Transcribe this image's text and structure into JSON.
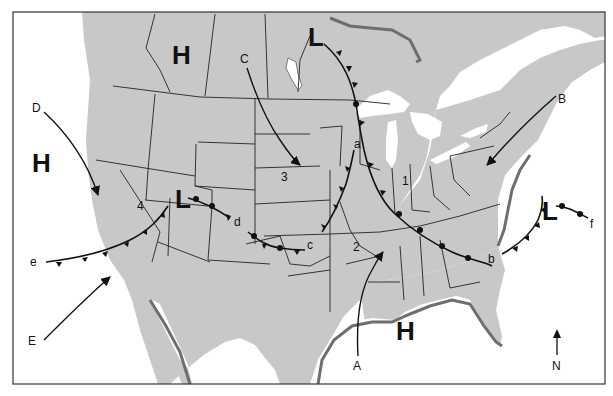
{
  "pressure_centers": [
    {
      "id": "high-canada",
      "symbol": "H",
      "type": "high"
    },
    {
      "id": "high-pacific",
      "symbol": "H",
      "type": "high"
    },
    {
      "id": "high-gulf",
      "symbol": "H",
      "type": "high"
    },
    {
      "id": "low-manitoba",
      "symbol": "L",
      "type": "low"
    },
    {
      "id": "low-utah",
      "symbol": "L",
      "type": "low"
    },
    {
      "id": "low-atlantic",
      "symbol": "L",
      "type": "low"
    }
  ],
  "fronts": [
    {
      "label": "a",
      "type": "cold"
    },
    {
      "label": "b",
      "type": "cold"
    },
    {
      "label": "c",
      "type": "stationary"
    },
    {
      "label": "d",
      "type": "warm"
    },
    {
      "label": "e",
      "type": "cold"
    },
    {
      "label": "f",
      "type": "warm"
    }
  ],
  "air_mass_arrows": [
    "A",
    "B",
    "C",
    "D",
    "E"
  ],
  "regions": [
    "1",
    "2",
    "3",
    "4"
  ],
  "compass": "N",
  "colors": {
    "land": "#c8c8c8",
    "water": "#ffffff",
    "coast_shadow": "#6e6e6e",
    "lines": "#1a1a1a"
  }
}
